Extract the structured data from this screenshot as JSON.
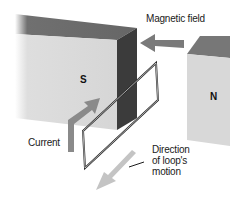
{
  "diagram": {
    "type": "physics-illustration",
    "labels": {
      "magnetic_field": "Magnetic field",
      "current": "Current",
      "direction_line1": "Direction",
      "direction_line2": "of loop's",
      "direction_line3": "motion"
    },
    "poles": {
      "south": "S",
      "north": "N"
    },
    "colors": {
      "magnet_top": "#6e6e6e",
      "magnet_front": "#d9d9d9",
      "magnet_side": "#3b3b3b",
      "field_arrow": "#7a7a7a",
      "current_arrow": "#8a8a8a",
      "motion_arrow": "#c4c4c4",
      "loop": "#2a2a2a"
    }
  }
}
